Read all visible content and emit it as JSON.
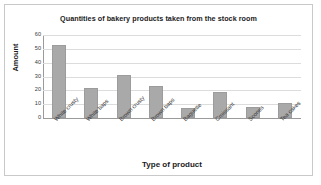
{
  "chart_data": {
    "type": "bar",
    "title": "Quantities of bakery products taken from the stock room",
    "xlabel": "Type of product",
    "ylabel": "Amount",
    "categories": [
      "White crusty",
      "White baps",
      "Brown crusty",
      "Brown baps",
      "Baguette",
      "Croissant",
      "Scones",
      "Tea cakes"
    ],
    "values": [
      53,
      22,
      31,
      23,
      7,
      19,
      8,
      11
    ],
    "ylim": [
      0,
      60
    ],
    "yticks": [
      0,
      10,
      20,
      30,
      40,
      50,
      60
    ],
    "ytick_labels": [
      "0",
      "10",
      "20",
      "30",
      "40",
      "50",
      "60"
    ],
    "grid": true,
    "legend": false,
    "bar_color": "#a9a9a9",
    "frame_color": "#c9c9c9",
    "axis_color": "#9a9a9a",
    "gridline_color": "#dcdcdc"
  }
}
